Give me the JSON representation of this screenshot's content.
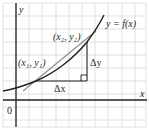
{
  "diagram": {
    "colors": {
      "background": "#ffffff",
      "grid": "#d9d9d9",
      "axis": "#231f20",
      "curve": "#231f20",
      "secant": "#8a8a8a",
      "triangle": "#231f20"
    },
    "axes": {
      "x_label": "x",
      "y_label": "y",
      "origin_label": "0"
    },
    "curve_label": "y = f(x)",
    "points": [
      {
        "id": "p1",
        "label": "(x₁, y₁)",
        "x": 36,
        "y": 81
      },
      {
        "id": "p2",
        "label": "(x₂, y₂)",
        "x": 87,
        "y": 42
      }
    ],
    "increments": {
      "dx_label": "Δx",
      "dy_label": "Δy"
    }
  }
}
